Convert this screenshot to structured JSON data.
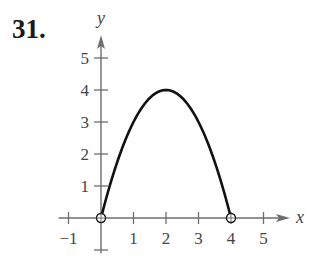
{
  "problem_number": "31.",
  "chart_data": {
    "type": "line",
    "title": "",
    "xlabel": "x",
    "ylabel": "y",
    "function": "y = 4x - x^2",
    "domain": [
      0,
      4
    ],
    "endpoints": [
      {
        "x": 0,
        "y": 0,
        "marker": "open-circle"
      },
      {
        "x": 4,
        "y": 0,
        "marker": "open-circle"
      }
    ],
    "vertex": {
      "x": 2,
      "y": 4
    },
    "x": [
      0,
      0.5,
      1,
      1.5,
      2,
      2.5,
      3,
      3.5,
      4
    ],
    "series": [
      {
        "name": "f(x)",
        "values": [
          0,
          1.75,
          3,
          3.75,
          4,
          3.75,
          3,
          1.75,
          0
        ]
      }
    ],
    "x_ticks": [
      "-1",
      "1",
      "2",
      "3",
      "4",
      "5"
    ],
    "y_ticks": [
      "1",
      "2",
      "3",
      "4",
      "5"
    ],
    "xlim": [
      -1.3,
      6
    ],
    "ylim": [
      -1.1,
      5.8
    ],
    "grid": false,
    "legend": "none"
  },
  "axes": {
    "x_label": "x",
    "y_label": "y",
    "x_tick_labels": [
      {
        "value": -1,
        "text": "−1"
      },
      {
        "value": 1,
        "text": "1"
      },
      {
        "value": 2,
        "text": "2"
      },
      {
        "value": 3,
        "text": "3"
      },
      {
        "value": 4,
        "text": "4"
      },
      {
        "value": 5,
        "text": "5"
      }
    ],
    "y_tick_labels": [
      {
        "value": 1,
        "text": "1"
      },
      {
        "value": 2,
        "text": "2"
      },
      {
        "value": 3,
        "text": "3"
      },
      {
        "value": 4,
        "text": "4"
      },
      {
        "value": 5,
        "text": "5"
      }
    ]
  },
  "colors": {
    "axis": "#6e6e6e",
    "curve": "#111111",
    "text": "#444444"
  }
}
